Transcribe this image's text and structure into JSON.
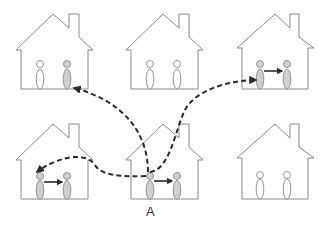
{
  "diagram": {
    "type": "household transmission illustration",
    "colors": {
      "house_outline": "#8a8a8a",
      "person_filled": "#cfcfcf",
      "person_empty": "#ffffff",
      "arrow": "#2b2b2b"
    },
    "houses": [
      {
        "id": "top-left",
        "row": 0,
        "col": 0,
        "persons": [
          {
            "filled": false
          },
          {
            "filled": true
          }
        ],
        "internal_arrow": false
      },
      {
        "id": "top-middle",
        "row": 0,
        "col": 1,
        "persons": [
          {
            "filled": false
          },
          {
            "filled": false
          }
        ],
        "internal_arrow": false
      },
      {
        "id": "top-right",
        "row": 0,
        "col": 2,
        "persons": [
          {
            "filled": true
          },
          {
            "filled": true
          }
        ],
        "internal_arrow": true
      },
      {
        "id": "bottom-left",
        "row": 1,
        "col": 0,
        "persons": [
          {
            "filled": true
          },
          {
            "filled": true
          }
        ],
        "internal_arrow": true
      },
      {
        "id": "bottom-middle",
        "row": 1,
        "col": 1,
        "persons": [
          {
            "filled": true
          },
          {
            "filled": true
          }
        ],
        "internal_arrow": true
      },
      {
        "id": "bottom-right",
        "row": 1,
        "col": 2,
        "persons": [
          {
            "filled": false
          },
          {
            "filled": false
          }
        ],
        "internal_arrow": false
      }
    ],
    "edges": [
      {
        "from": "bottom-middle.person-1",
        "to": "top-left.person-2",
        "style": "dashed"
      },
      {
        "from": "bottom-middle.person-1",
        "to": "top-right.person-1",
        "style": "dashed"
      },
      {
        "from": "bottom-middle.person-1",
        "to": "bottom-left.person-1",
        "style": "dashed"
      }
    ],
    "labels": {
      "index_case": "A"
    }
  }
}
